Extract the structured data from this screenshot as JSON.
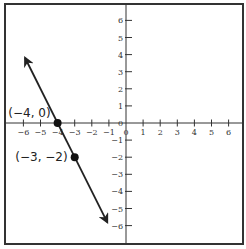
{
  "chart_data": {
    "type": "line",
    "title": "",
    "xlabel": "",
    "ylabel": "",
    "xlim": [
      -6,
      6
    ],
    "ylim": [
      -6,
      6
    ],
    "grid": false,
    "x_ticks": [
      -6,
      -5,
      -4,
      -3,
      -2,
      -1,
      0,
      1,
      2,
      3,
      4,
      5,
      6
    ],
    "y_ticks": [
      -6,
      -5,
      -4,
      -3,
      -2,
      -1,
      0,
      1,
      2,
      3,
      4,
      5,
      6
    ],
    "x_tick_labels": [
      "−6",
      "−5",
      "−4",
      "−3",
      "−2",
      "−1",
      "0",
      "1",
      "2",
      "3",
      "4",
      "5",
      "6"
    ],
    "y_tick_labels": [
      "−6",
      "−5",
      "−4",
      "−3",
      "−2",
      "−1",
      "0",
      "1",
      "2",
      "3",
      "4",
      "5",
      "6"
    ],
    "series": [
      {
        "name": "line",
        "equation": "y = -2x - 8",
        "slope": -2,
        "intercept": -8,
        "arrow_start": [
          -5.9,
          3.8
        ],
        "arrow_end": [
          -1.1,
          -5.8
        ],
        "color": "#222222"
      }
    ],
    "points": [
      {
        "x": -4,
        "y": 0,
        "label": "(−4, 0)"
      },
      {
        "x": -3,
        "y": -2,
        "label": "(−3, −2)"
      }
    ]
  }
}
